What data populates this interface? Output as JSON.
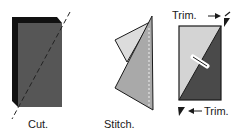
{
  "panels": [
    {
      "id": "cut",
      "caption": "Cut."
    },
    {
      "id": "stitch",
      "caption": "Stitch."
    },
    {
      "id": "trim",
      "caption_top": "Trim.",
      "caption_bottom": "Trim."
    }
  ],
  "colors": {
    "block_dark": "#111111",
    "block_face": "#555555",
    "light_fabric": "#d6d6d6",
    "mid_fabric": "#a8a8a8",
    "dark_fabric": "#4a4a4a",
    "outline": "#1a1a1a"
  }
}
